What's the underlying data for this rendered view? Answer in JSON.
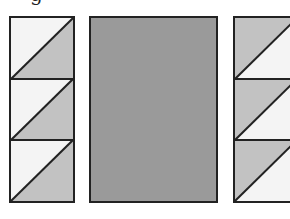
{
  "figure": {
    "caption_fragment": "g",
    "colors": {
      "outline": "#222222",
      "light": "#f4f4f4",
      "medium_gray": "#c2c2c2",
      "dark_gray": "#9a9a9a"
    },
    "panels": [
      {
        "id": "left",
        "type": "stacked-half-square-triangles",
        "rows": 3,
        "diagonal": "bottom-left to top-right",
        "upper_triangle": "light",
        "lower_triangle": "medium_gray"
      },
      {
        "id": "center",
        "type": "solid-rectangle",
        "fill": "dark_gray"
      },
      {
        "id": "right",
        "type": "stacked-half-square-triangles",
        "rows": 3,
        "diagonal": "bottom-left to top-right",
        "upper_triangle": "medium_gray",
        "lower_triangle": "light",
        "cropped": true
      }
    ]
  }
}
